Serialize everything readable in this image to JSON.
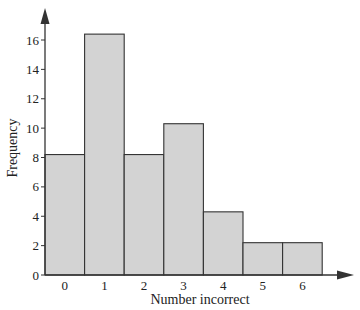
{
  "chart_data": {
    "type": "bar",
    "title": "",
    "xlabel": "Number incorrect",
    "ylabel": "Frequency",
    "categories": [
      "0",
      "1",
      "2",
      "3",
      "4",
      "5",
      "6"
    ],
    "values": [
      8.2,
      16.4,
      8.2,
      10.3,
      4.3,
      2.2,
      2.2
    ],
    "yticks": [
      0,
      2,
      4,
      6,
      8,
      10,
      12,
      14,
      16
    ],
    "ylim": [
      0,
      17
    ],
    "grid": false,
    "legend": null,
    "bar_color": "#d3d3d3",
    "edge_color": "#333333"
  }
}
